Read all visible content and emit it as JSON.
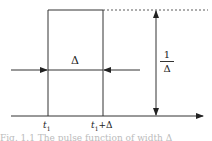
{
  "diagram": {
    "type": "rectangular-pulse",
    "labels": {
      "width": "Δ",
      "height_num": "1",
      "height_den": "Δ",
      "t_start": "t",
      "t_start_sub": "1",
      "t_end": "t",
      "t_end_sub": "1",
      "t_end_suffix": "+Δ"
    },
    "caption": "Fig. 1.1   The pulse function of width Δ"
  }
}
